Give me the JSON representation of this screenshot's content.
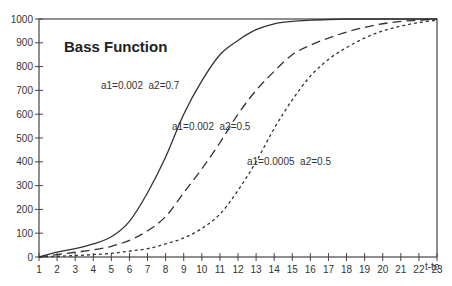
{
  "chart_data": {
    "type": "line",
    "title": "Bass Function",
    "xlabel": "t-to",
    "ylabel": "",
    "xlim": [
      1,
      23
    ],
    "ylim": [
      0,
      1000
    ],
    "grid": false,
    "legend": "none (inline annotations)",
    "x": [
      1,
      2,
      3,
      4,
      5,
      6,
      7,
      8,
      9,
      10,
      11,
      12,
      13,
      14,
      15,
      16,
      17,
      18,
      19,
      20,
      21,
      22,
      23
    ],
    "x_ticks": [
      "1",
      "2",
      "3",
      "4",
      "5",
      "6",
      "7",
      "8",
      "9",
      "10",
      "11",
      "12",
      "13",
      "14",
      "15",
      "16",
      "17",
      "18",
      "19",
      "20",
      "21",
      "22",
      "23"
    ],
    "y_ticks": [
      "0",
      "100",
      "200",
      "300",
      "400",
      "500",
      "600",
      "700",
      "800",
      "900",
      "1000"
    ],
    "series": [
      {
        "name": "a1=0.002  a2=0.7",
        "style": "solid",
        "values": [
          0,
          20,
          35,
          55,
          85,
          150,
          270,
          420,
          600,
          740,
          850,
          910,
          955,
          980,
          990,
          995,
          998,
          1000,
          1000,
          1000,
          1000,
          1000,
          1000
        ],
        "label_pos": [
          155,
          90
        ]
      },
      {
        "name": "a1=0.002  a2=0.5",
        "style": "long-dash",
        "values": [
          0,
          10,
          20,
          30,
          45,
          70,
          110,
          170,
          270,
          370,
          480,
          600,
          700,
          780,
          850,
          890,
          920,
          945,
          965,
          980,
          990,
          995,
          1000
        ],
        "label_pos": [
          172,
          132
        ]
      },
      {
        "name": "a1=0.0005  a2=0.5",
        "style": "short-dash",
        "values": [
          0,
          3,
          6,
          10,
          15,
          25,
          35,
          55,
          80,
          120,
          180,
          280,
          400,
          540,
          660,
          760,
          830,
          880,
          920,
          950,
          970,
          985,
          995
        ],
        "label_pos": [
          247,
          166
        ]
      }
    ],
    "annotations": [
      {
        "text": "Bass Function",
        "x": 64,
        "y": 48
      },
      {
        "text": "a1=0.002  a2=0.7",
        "x": 101,
        "y": 89
      },
      {
        "text": "a1=0.002  a2=0.5",
        "x": 172,
        "y": 130
      },
      {
        "text": "a1=0.0005  a2=0.5",
        "x": 247,
        "y": 165
      }
    ]
  },
  "colors": {
    "axis": "#444444",
    "line": "#333333",
    "text": "#333333",
    "background": "#ffffff"
  }
}
